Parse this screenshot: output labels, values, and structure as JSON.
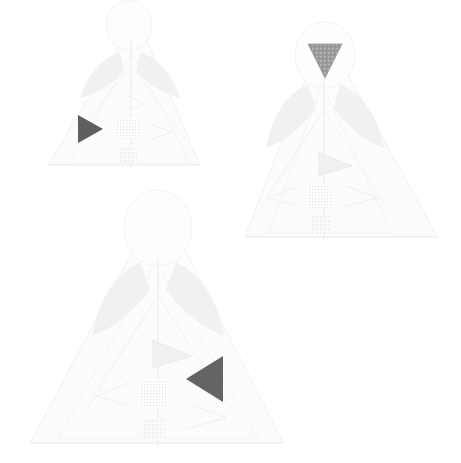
{
  "image": {
    "title": "Three faint triangular figures with gray marker triangles",
    "background_color": "#ffffff",
    "width": 461,
    "height": 463
  },
  "palette": {
    "background": "#ffffff",
    "outline_faint": "#f4f4f4",
    "outline_faint2": "#f0f0f0",
    "fill_very_light": "#fbfbfb",
    "fill_light": "#f7f7f7",
    "wing_shade": "#f2f2f2",
    "box_shade": "#f0f0f0",
    "marker_dark": "#5f5f5f",
    "marker_mid": "#9c9c9c",
    "marker_dark_alt": "#646464"
  },
  "figures": [
    {
      "id": "figure-1",
      "label": "Figure 1",
      "position": "top-left",
      "apex": {
        "x": 137,
        "y": 18
      },
      "base_left": {
        "x": 48,
        "y": 165
      },
      "base_right": {
        "x": 200,
        "y": 165
      },
      "marker": {
        "name": "marker-triangle-right",
        "orientation": "right",
        "color": "#5f5f5f",
        "x": 78,
        "y": 115,
        "width": 25,
        "height": 28
      }
    },
    {
      "id": "figure-2",
      "label": "Figure 2",
      "position": "top-right",
      "apex": {
        "x": 324,
        "y": 32
      },
      "base_left": {
        "x": 245,
        "y": 237
      },
      "base_right": {
        "x": 438,
        "y": 237
      },
      "marker": {
        "name": "marker-triangle-down",
        "orientation": "down",
        "color": "#9c9c9c",
        "x": 308,
        "y": 44,
        "width": 34,
        "height": 34
      }
    },
    {
      "id": "figure-3",
      "label": "Figure 3",
      "position": "bottom-center",
      "apex": {
        "x": 160,
        "y": 200
      },
      "base_left": {
        "x": 30,
        "y": 443
      },
      "base_right": {
        "x": 283,
        "y": 443
      },
      "marker": {
        "name": "marker-triangle-left",
        "orientation": "left",
        "color": "#646464",
        "x": 186,
        "y": 356,
        "width": 37,
        "height": 46
      }
    }
  ]
}
